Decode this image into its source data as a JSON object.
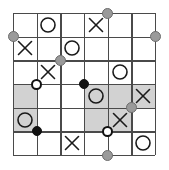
{
  "puzzle": {
    "title": "Grid Puzzle Board",
    "grid": {
      "rows": 6,
      "cols": 6,
      "cell_size": 23.67,
      "origin_x": 13,
      "origin_y": 13,
      "line_color": "#4a4a4a",
      "background_color": "#ffffff",
      "shade_color": "#d2d2d2"
    },
    "shaded_cells": [
      {
        "row": 3,
        "col": 0
      },
      {
        "row": 3,
        "col": 3
      },
      {
        "row": 3,
        "col": 4
      },
      {
        "row": 3,
        "col": 5
      },
      {
        "row": 4,
        "col": 0
      },
      {
        "row": 4,
        "col": 3
      },
      {
        "row": 4,
        "col": 4
      }
    ],
    "marks": [
      {
        "row": 0,
        "col": 1,
        "symbol": "O",
        "name": "circle-mark"
      },
      {
        "row": 0,
        "col": 3,
        "symbol": "X",
        "name": "cross-mark"
      },
      {
        "row": 1,
        "col": 0,
        "symbol": "X",
        "name": "cross-mark"
      },
      {
        "row": 1,
        "col": 2,
        "symbol": "O",
        "name": "circle-mark"
      },
      {
        "row": 2,
        "col": 1,
        "symbol": "X",
        "name": "cross-mark"
      },
      {
        "row": 2,
        "col": 4,
        "symbol": "O",
        "name": "circle-mark"
      },
      {
        "row": 3,
        "col": 3,
        "symbol": "O",
        "name": "circle-mark"
      },
      {
        "row": 3,
        "col": 5,
        "symbol": "X",
        "name": "cross-mark"
      },
      {
        "row": 4,
        "col": 0,
        "symbol": "O",
        "name": "circle-mark"
      },
      {
        "row": 4,
        "col": 4,
        "symbol": "X",
        "name": "cross-mark"
      },
      {
        "row": 5,
        "col": 2,
        "symbol": "X",
        "name": "cross-mark"
      },
      {
        "row": 5,
        "col": 5,
        "symbol": "O",
        "name": "circle-mark"
      }
    ],
    "vertices": [
      {
        "row": 1,
        "col": 0,
        "kind": "gray",
        "name": "gray-node"
      },
      {
        "row": 0,
        "col": 4,
        "kind": "gray",
        "name": "gray-node"
      },
      {
        "row": 1,
        "col": 6,
        "kind": "gray",
        "name": "gray-node"
      },
      {
        "row": 2,
        "col": 2,
        "kind": "gray",
        "name": "gray-node"
      },
      {
        "row": 4,
        "col": 5,
        "kind": "gray",
        "name": "gray-node"
      },
      {
        "row": 6,
        "col": 4,
        "kind": "gray",
        "name": "gray-node"
      },
      {
        "row": 3,
        "col": 1,
        "kind": "white",
        "name": "white-node"
      },
      {
        "row": 3,
        "col": 3,
        "kind": "black",
        "name": "black-node"
      },
      {
        "row": 5,
        "col": 1,
        "kind": "black",
        "name": "black-node"
      },
      {
        "row": 5,
        "col": 4,
        "kind": "white",
        "name": "white-node"
      }
    ],
    "counts": {
      "circles": 6,
      "crosses": 6,
      "gray_nodes": 6,
      "black_nodes": 2,
      "white_nodes": 2
    }
  }
}
